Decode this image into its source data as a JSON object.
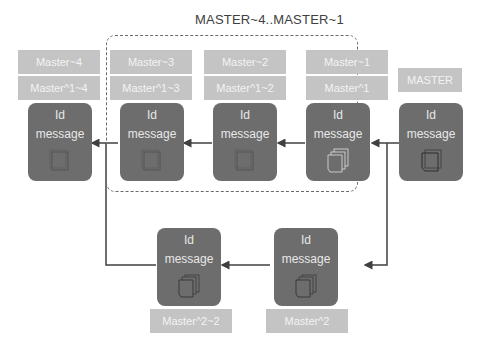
{
  "diagram": {
    "group_title": "MASTER~4..MASTER~1",
    "head_label": "MASTER",
    "commits_top": [
      {
        "id": "Id",
        "message": "message",
        "labels": [
          "Master~4",
          "Master^1~4"
        ],
        "icon": "file-icon"
      },
      {
        "id": "Id",
        "message": "message",
        "labels": [
          "Master~3",
          "Master^1~3"
        ],
        "icon": "file-icon"
      },
      {
        "id": "Id",
        "message": "message",
        "labels": [
          "Master~2",
          "Master^1~2"
        ],
        "icon": "file-icon"
      },
      {
        "id": "Id",
        "message": "message",
        "labels": [
          "Master~1",
          "Master^1"
        ],
        "icon": "stacked-files-icon"
      },
      {
        "id": "Id",
        "message": "message",
        "labels": [
          "MASTER"
        ],
        "icon": "file-icon"
      }
    ],
    "commits_bottom": [
      {
        "id": "Id",
        "message": "message",
        "labels": [
          "Master^2~2"
        ],
        "icon": "stacked-files-icon"
      },
      {
        "id": "Id",
        "message": "message",
        "labels": [
          "Master^2"
        ],
        "icon": "stacked-files-icon"
      }
    ],
    "colors": {
      "commit_fill": "#6d6d6d",
      "label_fill": "#c4c4c4",
      "line": "#404040"
    }
  }
}
